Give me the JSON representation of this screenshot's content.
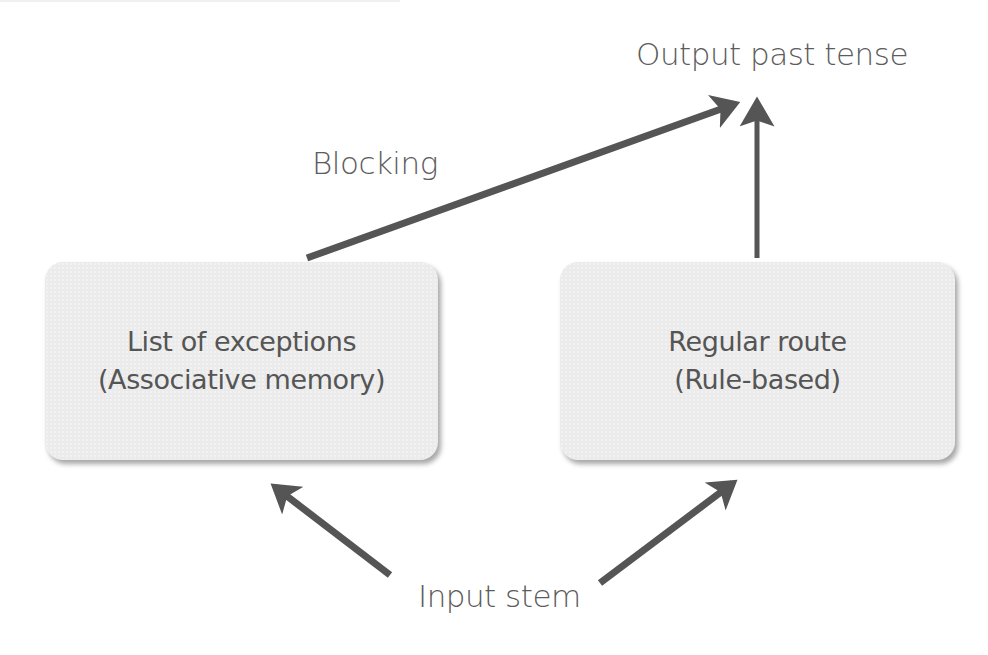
{
  "diagram": {
    "nodes": {
      "output": {
        "label": "Output past tense"
      },
      "exceptions": {
        "line1": "List of exceptions",
        "line2": "(Associative memory)"
      },
      "regular": {
        "line1": "Regular route",
        "line2": "(Rule-based)"
      },
      "input": {
        "label": "Input stem"
      }
    },
    "edges": [
      {
        "from": "exceptions",
        "to": "output",
        "label": "Blocking"
      },
      {
        "from": "regular",
        "to": "output",
        "label": ""
      },
      {
        "from": "input",
        "to": "exceptions",
        "label": ""
      },
      {
        "from": "input",
        "to": "regular",
        "label": ""
      }
    ],
    "edge_label_blocking": "Blocking",
    "colors": {
      "arrow": "#555555",
      "box_fill": "#ebebeb",
      "text": "#5a5a5a"
    }
  }
}
